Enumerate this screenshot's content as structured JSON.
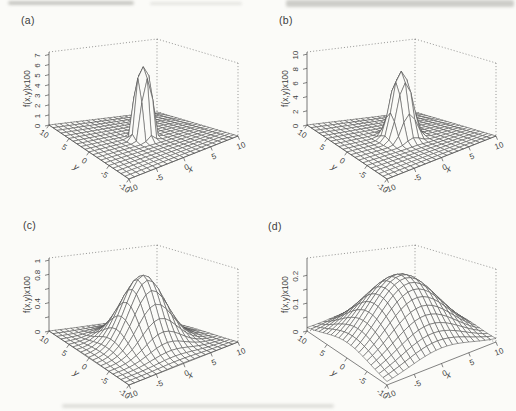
{
  "page": {
    "width": 516,
    "height": 411,
    "background": "#fbfbf8",
    "line_color": "#4d4d4d",
    "text_color": "#3e3e3e"
  },
  "chart_data": [
    {
      "id": "a",
      "label": "(a)",
      "type": "surface3d-wireframe",
      "axes": {
        "x_label": "x",
        "y_label": "y",
        "z_label": "f(x,y)x100",
        "x_range": [
          -10,
          10
        ],
        "y_range": [
          -10,
          10
        ],
        "z_max": 7.25,
        "x_ticks": [
          {
            "v": -10,
            "t": "-10"
          },
          {
            "v": -5,
            "t": "-5"
          },
          {
            "v": 0,
            "t": "0"
          },
          {
            "v": 5,
            "t": "5"
          },
          {
            "v": 10,
            "t": "10"
          }
        ],
        "y_ticks": [
          {
            "v": 10,
            "t": "10"
          },
          {
            "v": 5,
            "t": "5"
          },
          {
            "v": 0,
            "t": "0"
          },
          {
            "v": -5,
            "t": "-5"
          },
          {
            "v": -10,
            "t": "-10"
          }
        ],
        "z_ticks": [
          {
            "v": 0,
            "t": "0"
          },
          {
            "v": 1,
            "t": "1"
          },
          {
            "v": 2,
            "t": "2"
          },
          {
            "v": 3,
            "t": "3"
          },
          {
            "v": 4,
            "t": "4"
          },
          {
            "v": 5,
            "t": "5"
          },
          {
            "v": 6,
            "t": "6"
          },
          {
            "v": 7,
            "t": "7"
          }
        ]
      },
      "surface": {
        "model": "radial_exp",
        "formula": "z = peak * exp(-0.5*(r/sigma)^exponent), r = sqrt(x^2+y^2)",
        "peak": 7.07,
        "sigma": 1.35,
        "exponent": 4,
        "grid": 21,
        "description": "very narrow tall flat-topped spike at origin, flat floor elsewhere"
      }
    },
    {
      "id": "b",
      "label": "(b)",
      "type": "surface3d-wireframe",
      "axes": {
        "x_label": "x",
        "y_label": "y",
        "z_label": "f(x,y)x100",
        "x_range": [
          -10,
          10
        ],
        "y_range": [
          -10,
          10
        ],
        "z_max": 10.3,
        "x_ticks": [
          {
            "v": -10,
            "t": "-10"
          },
          {
            "v": -5,
            "t": "-5"
          },
          {
            "v": 0,
            "t": "0"
          },
          {
            "v": 5,
            "t": "5"
          },
          {
            "v": 10,
            "t": "10"
          }
        ],
        "y_ticks": [
          {
            "v": 10,
            "t": "10"
          },
          {
            "v": 5,
            "t": "5"
          },
          {
            "v": 0,
            "t": "0"
          },
          {
            "v": -5,
            "t": "-5"
          },
          {
            "v": -10,
            "t": "-10"
          }
        ],
        "z_ticks": [
          {
            "v": 0,
            "t": "0"
          },
          {
            "v": 2,
            "t": "2"
          },
          {
            "v": 4,
            "t": "4"
          },
          {
            "v": 6,
            "t": "6"
          },
          {
            "v": 8,
            "t": "8"
          },
          {
            "v": 10,
            "t": "10"
          }
        ]
      },
      "surface": {
        "model": "radial_exp",
        "formula": "z = peak * exp(-0.5*(r/sigma)^exponent), r = sqrt(x^2+y^2)",
        "peak": 9.4,
        "sigma": 1.6,
        "exponent": 2.5,
        "grid": 21,
        "description": "narrow tall spike with short terraced skirt, flat floor elsewhere"
      }
    },
    {
      "id": "c",
      "label": "(c)",
      "type": "surface3d-wireframe",
      "axes": {
        "x_label": "x",
        "y_label": "y",
        "z_label": "f(x,y)x100",
        "x_range": [
          -10,
          10
        ],
        "y_range": [
          -10,
          10
        ],
        "z_max": 1.03,
        "x_ticks": [
          {
            "v": -10,
            "t": "-10"
          },
          {
            "v": -5,
            "t": "-5"
          },
          {
            "v": 0,
            "t": "0"
          },
          {
            "v": 5,
            "t": "5"
          },
          {
            "v": 10,
            "t": "10"
          }
        ],
        "y_ticks": [
          {
            "v": 10,
            "t": "10"
          },
          {
            "v": 5,
            "t": "5"
          },
          {
            "v": 0,
            "t": "0"
          },
          {
            "v": -5,
            "t": "-5"
          },
          {
            "v": -10,
            "t": "-10"
          }
        ],
        "z_ticks": [
          {
            "v": 0,
            "t": "0"
          },
          {
            "v": 0.2,
            "t": ""
          },
          {
            "v": 0.4,
            "t": "0.4"
          },
          {
            "v": 0.6,
            "t": ""
          },
          {
            "v": 0.8,
            "t": "0.8"
          },
          {
            "v": 1,
            "t": "1"
          }
        ]
      },
      "surface": {
        "model": "radial_exp",
        "formula": "z = peak * exp(-0.5*(r/sigma)^exponent), r = sqrt(x^2+y^2)",
        "peak": 0.97,
        "sigma": 3.3,
        "exponent": 2,
        "grid": 21,
        "description": "medium-width smooth gaussian dome reaching near zero at domain edges"
      }
    },
    {
      "id": "d",
      "label": "(d)",
      "type": "surface3d-wireframe",
      "axes": {
        "x_label": "x",
        "y_label": "y",
        "z_label": "f(x,y)x100",
        "x_range": [
          -10,
          10
        ],
        "y_range": [
          -10,
          10
        ],
        "z_max": 0.262,
        "x_ticks": [
          {
            "v": -10,
            "t": "-10"
          },
          {
            "v": -5,
            "t": "-5"
          },
          {
            "v": 0,
            "t": "0"
          },
          {
            "v": 5,
            "t": "5"
          },
          {
            "v": 10,
            "t": "10"
          }
        ],
        "y_ticks": [
          {
            "v": 10,
            "t": "10"
          },
          {
            "v": 5,
            "t": "5"
          },
          {
            "v": 0,
            "t": "0"
          },
          {
            "v": -5,
            "t": "-5"
          },
          {
            "v": -10,
            "t": "-10"
          }
        ],
        "z_ticks": [
          {
            "v": 0,
            "t": "0"
          },
          {
            "v": 0.05,
            "t": ""
          },
          {
            "v": 0.1,
            "t": "0.1"
          },
          {
            "v": 0.15,
            "t": ""
          },
          {
            "v": 0.2,
            "t": "0.2"
          }
        ]
      },
      "surface": {
        "model": "radial_exp",
        "formula": "z = peak * exp(-0.5*(r/sigma)^exponent), r = sqrt(x^2+y^2)",
        "peak": 0.247,
        "sigma": 5.8,
        "exponent": 2,
        "grid": 21,
        "description": "broad low gaussian dome, surface still elevated at domain edges"
      }
    }
  ]
}
